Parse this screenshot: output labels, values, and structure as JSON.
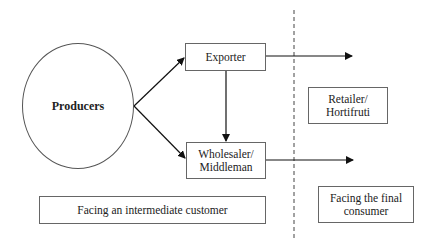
{
  "diagram": {
    "type": "flow",
    "nodes": {
      "producers": "Producers",
      "exporter": "Exporter",
      "wholesaler_line1": "Wholesaler/",
      "wholesaler_line2": "Middleman",
      "retailer_line1": "Retailer/",
      "retailer_line2": "Hortifruti"
    },
    "regions": {
      "intermediate": "Facing an intermediate customer",
      "final_line1": "Facing the final",
      "final_line2": "consumer"
    },
    "edges": [
      {
        "from": "Producers",
        "to": "Exporter"
      },
      {
        "from": "Producers",
        "to": "Wholesaler/Middleman"
      },
      {
        "from": "Exporter",
        "to": "Wholesaler/Middleman"
      },
      {
        "from": "Exporter",
        "to": "final consumer side"
      },
      {
        "from": "Wholesaler/Middleman",
        "to": "final consumer side"
      }
    ],
    "colors": {
      "line": "#111111",
      "box_border": "#666666",
      "background": "#ffffff"
    }
  }
}
